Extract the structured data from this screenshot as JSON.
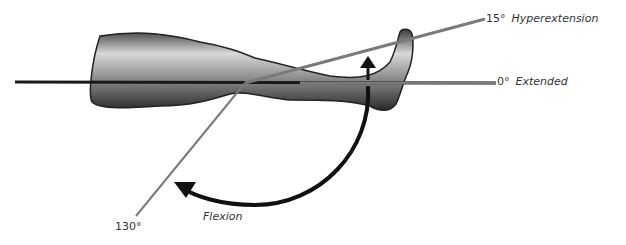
{
  "diagram": {
    "labels": {
      "hyperextension_angle": "15°",
      "hyperextension_text": "Hyperextension",
      "extended_angle": "0°",
      "extended_text": "Extended",
      "flexion_angle": "130°",
      "flexion_text": "Flexion"
    },
    "colors": {
      "reference_line": "#1a1a1a",
      "angle_line": "#7a7a7a",
      "arrow": "#111111",
      "leg_dark": "#2a2a2a",
      "leg_light": "#d8d8d8"
    }
  }
}
